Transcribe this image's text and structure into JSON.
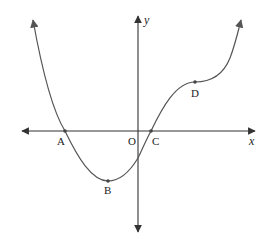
{
  "diagram": {
    "type": "function-graph",
    "axes": {
      "x_label": "x",
      "y_label": "y",
      "origin_label": "O"
    },
    "points": [
      {
        "id": "A",
        "label": "A",
        "description": "x-intercept (left)"
      },
      {
        "id": "B",
        "label": "B",
        "description": "local minimum"
      },
      {
        "id": "C",
        "label": "C",
        "description": "x-intercept (right)"
      },
      {
        "id": "D",
        "label": "D",
        "description": "stationary point of inflection"
      }
    ],
    "colors": {
      "curve": "#555555",
      "axes": "#333333",
      "background": "#ffffff"
    }
  }
}
